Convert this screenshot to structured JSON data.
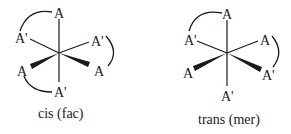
{
  "diagram": {
    "colors": {
      "ink": "#1a1a1a",
      "background": "#ffffff"
    },
    "isomers": [
      {
        "caption": "cis (fac)",
        "ligands": {
          "top": "A",
          "upper_left": "A'",
          "upper_right": "A'",
          "lower_left": "A",
          "lower_right": "A",
          "bottom": "A'"
        },
        "arcs": [
          "top-to-upper_left",
          "upper_right-to-lower_right",
          "lower_left-to-bottom"
        ]
      },
      {
        "caption": "trans (mer)",
        "ligands": {
          "top": "A",
          "upper_left": "A'",
          "upper_right": "A",
          "lower_left": "A",
          "lower_right": "A'",
          "bottom": "A'"
        },
        "arcs": [
          "top-to-upper_left",
          "upper_right-to-lower_right"
        ]
      }
    ]
  }
}
